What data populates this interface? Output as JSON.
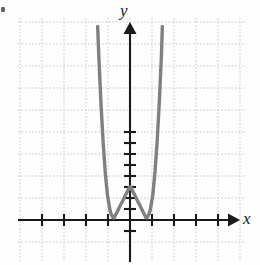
{
  "figure": {
    "title": "",
    "background_color": "#fefefe",
    "corner_mark": "",
    "width": 260,
    "height": 265
  },
  "axes": {
    "x_label": "x",
    "y_label": "y",
    "axis_color": "#1a1a1a",
    "grid_color": "#c8c8c8",
    "grid_style": "dotted",
    "grid_spacing_units": 1,
    "x_arrow": "arrow-right",
    "y_arrow": "arrow-up"
  },
  "curve": {
    "color": "#808080",
    "stroke_width": 3.4,
    "arrow_left": "arrow-up",
    "arrow_right": "arrow-up"
  },
  "chart_data": {
    "type": "line",
    "title": "",
    "xlabel": "x",
    "ylabel": "y",
    "grid": true,
    "legend": "none",
    "xlim": [
      -5.1,
      5.3
    ],
    "ylim": [
      -2.0,
      9.2
    ],
    "xticks": [
      -4,
      -3,
      -2,
      -1,
      1,
      2,
      3,
      4
    ],
    "yticks": [
      -1,
      1,
      2,
      3,
      4,
      5,
      6,
      7,
      8
    ],
    "roots": [
      -1,
      1
    ],
    "local_maximum": [
      0,
      0.5
    ],
    "local_minima": [
      [
        -1,
        0
      ],
      [
        1,
        0
      ]
    ],
    "series": [
      {
        "name": "quartic",
        "equation": "y = 2(x^2 - 1)^2",
        "x": [
          -1.47,
          -1.42,
          -1.37,
          -1.32,
          -1.27,
          -1.22,
          -1.17,
          -1.12,
          -1.07,
          -1.02,
          -0.97,
          -0.92,
          -0.87,
          -0.82,
          -0.77,
          -0.72,
          -0.67,
          -0.62,
          -0.57,
          -0.52,
          -0.47,
          -0.42,
          -0.37,
          -0.32,
          -0.27,
          -0.22,
          -0.17,
          -0.12,
          -0.07,
          -0.02,
          0.03,
          0.08,
          0.13,
          0.18,
          0.23,
          0.28,
          0.33,
          0.38,
          0.43,
          0.48,
          0.53,
          0.58,
          0.63,
          0.68,
          0.73,
          0.78,
          0.83,
          0.88,
          0.93,
          0.98,
          1.03,
          1.08,
          1.13,
          1.18,
          1.23,
          1.28,
          1.33,
          1.38,
          1.43,
          1.47
        ],
        "y": [
          8.8,
          7.5,
          6.4,
          5.3,
          4.4,
          3.5,
          2.8,
          2.1,
          1.6,
          1.1,
          0.8,
          0.5,
          0.3,
          0.2,
          0.1,
          0.1,
          0.2,
          0.3,
          0.4,
          0.5,
          0.6,
          0.7,
          0.8,
          0.9,
          1.0,
          1.1,
          1.2,
          1.3,
          1.4,
          1.5,
          1.5,
          1.4,
          1.3,
          1.2,
          1.1,
          1.0,
          0.9,
          0.8,
          0.7,
          0.6,
          0.5,
          0.4,
          0.3,
          0.2,
          0.1,
          0.1,
          0.2,
          0.3,
          0.5,
          0.8,
          1.1,
          1.6,
          2.1,
          2.8,
          3.5,
          4.4,
          5.3,
          6.4,
          7.5,
          8.8
        ]
      }
    ]
  }
}
